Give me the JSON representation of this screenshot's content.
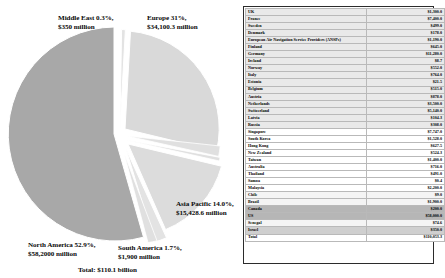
{
  "chart_data": {
    "type": "pie",
    "title": "",
    "total_label": "Total: $110.1 billion",
    "categories": [
      "North America",
      "Europe",
      "Asia Pacific",
      "South America",
      "Middle East"
    ],
    "values": [
      52.9,
      31.0,
      14.0,
      1.7,
      0.3
    ],
    "value_unit": "percent",
    "amounts_million": [
      58200.0,
      34100.3,
      15428.6,
      1900.0,
      350.0
    ],
    "labels": [
      "North America 52.9%, $58,2000 million",
      "Europe 31%, $34,100.3 million",
      "Asia Pacific 14.0%, $15,428.6 million",
      "South America 1.7%, $1,900 million",
      "Middle East 0.3%, $350 million"
    ],
    "colors": [
      "#a8a8a8",
      "#d8d8d8",
      "#d8d8d8",
      "#e2e2e2",
      "#e2e2e2"
    ],
    "legend": "none",
    "grid": false
  },
  "pie": {
    "labels": {
      "middle_east_line1": "Middle East 0.3%,",
      "middle_east_line2": "$350 million",
      "europe_line1": "Europe 31%,",
      "europe_line2": "$34,100.3 million",
      "asia_line1": "Asia Pacific 14.0%,",
      "asia_line2": "$15,428.6 million",
      "south_america_line1": "South America 1.7%,",
      "south_america_line2": "$1,900 million",
      "north_america_line1": "North America 52.9%,",
      "north_america_line2": "$58,2000 million",
      "total": "Total: $110.1 billion"
    }
  },
  "table": {
    "rows": [
      {
        "name": "UK",
        "value": "$1,300.0",
        "style": "shade-a"
      },
      {
        "name": "France",
        "value": "$7,400.0",
        "style": "shade-a"
      },
      {
        "name": "Sweden",
        "value": "$499.0",
        "style": "shade-a"
      },
      {
        "name": "Denmark",
        "value": "$178.0",
        "style": "shade-a"
      },
      {
        "name": "European Air Navigation Service Providers (ANSPs)",
        "value": "$1,190.0",
        "style": "shade-a"
      },
      {
        "name": "Finland",
        "value": "$645.0",
        "style": "shade-a"
      },
      {
        "name": "Germany",
        "value": "$11,280.0",
        "style": "shade-a"
      },
      {
        "name": "Ireland",
        "value": "$8.7",
        "style": "shade-a"
      },
      {
        "name": "Norway",
        "value": "$552.0",
        "style": "shade-a"
      },
      {
        "name": "Italy",
        "value": "$764.0",
        "style": "shade-a"
      },
      {
        "name": "Estonia",
        "value": "$21.5",
        "style": "shade-a"
      },
      {
        "name": "Belgium",
        "value": "$515.0",
        "style": "shade-a"
      },
      {
        "name": "Austria",
        "value": "$878.0",
        "style": "shade-a"
      },
      {
        "name": "Netherlands",
        "value": "$3,500.0",
        "style": "shade-a"
      },
      {
        "name": "Switzerland",
        "value": "$5,140.0",
        "style": "shade-a"
      },
      {
        "name": "Latvia",
        "value": "$104.3",
        "style": "shade-a"
      },
      {
        "name": "Russia",
        "value": "$308.0",
        "style": "shade-a"
      },
      {
        "name": "Singapore",
        "value": "$7,747.0",
        "style": "shade-c"
      },
      {
        "name": "South Korea",
        "value": "$1,528.0",
        "style": "shade-c"
      },
      {
        "name": "Hong Kong",
        "value": "$627.5",
        "style": "shade-c"
      },
      {
        "name": "New Zealand",
        "value": "$524.3",
        "style": "shade-c"
      },
      {
        "name": "Taiwan",
        "value": "$1,400.0",
        "style": "shade-c"
      },
      {
        "name": "Australia",
        "value": "$716.0",
        "style": "shade-c"
      },
      {
        "name": "Thailand",
        "value": "$491.0",
        "style": "shade-c"
      },
      {
        "name": "Samoa",
        "value": "$0.4",
        "style": "shade-c"
      },
      {
        "name": "Malaysia",
        "value": "$2,200.0",
        "style": "shade-c"
      },
      {
        "name": "Chile",
        "value": "$9.0",
        "style": "shade-b"
      },
      {
        "name": "Brazil",
        "value": "$1,900.0",
        "style": "shade-b"
      },
      {
        "name": "Canada",
        "value": "$200.0",
        "style": "hl-dark"
      },
      {
        "name": "US",
        "value": "$58,000.0",
        "style": "hl-dark"
      },
      {
        "name": "Senegal",
        "value": "$74.6",
        "style": "shade-b"
      },
      {
        "name": "Israel",
        "value": "$350.0",
        "style": "hl-mid"
      },
      {
        "name": "Total",
        "value": "$110,053.3",
        "style": "total"
      }
    ]
  }
}
